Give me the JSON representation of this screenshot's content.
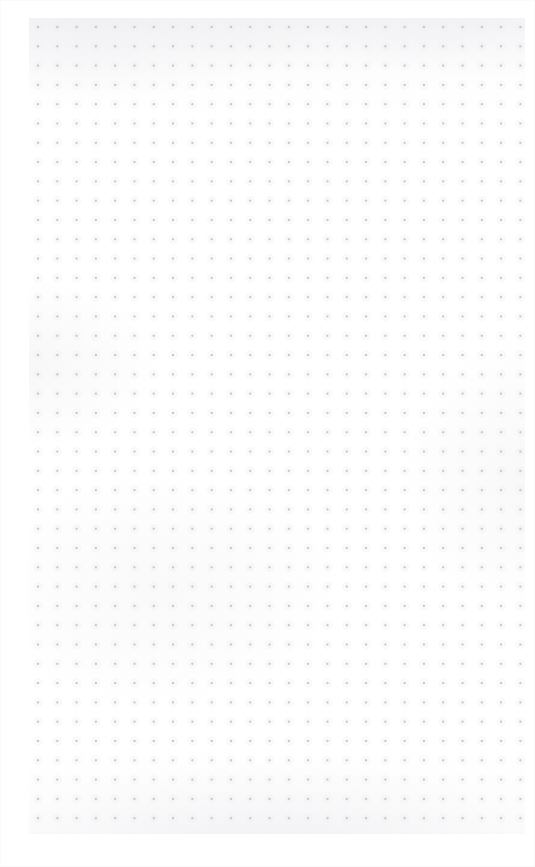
{
  "document": {
    "type": "dot-grid-paper",
    "title": "Blank dot grid page",
    "content_text": "",
    "page_width_px": 535,
    "page_height_px": 867
  },
  "paper": {
    "background_color": "#fdfdfd",
    "texture": "subtle mottled scan texture",
    "has_visible_text": "false",
    "has_handwriting": "false",
    "has_ruling_lines": "false"
  },
  "grid": {
    "style": "dot",
    "dot_color": "#c9c9ce",
    "halo_color": "#eeeef1",
    "dot_diameter_px": 1.7,
    "spacing_px": 19.3,
    "columns": 26,
    "rows": 42,
    "first_dot_x_px": 38,
    "first_dot_y_px": 27,
    "last_dot_x_px": 516,
    "last_dot_y_px": 825,
    "margin_left_px": 38,
    "margin_top_px": 27,
    "margin_right_px": 19,
    "margin_bottom_px": 42
  }
}
